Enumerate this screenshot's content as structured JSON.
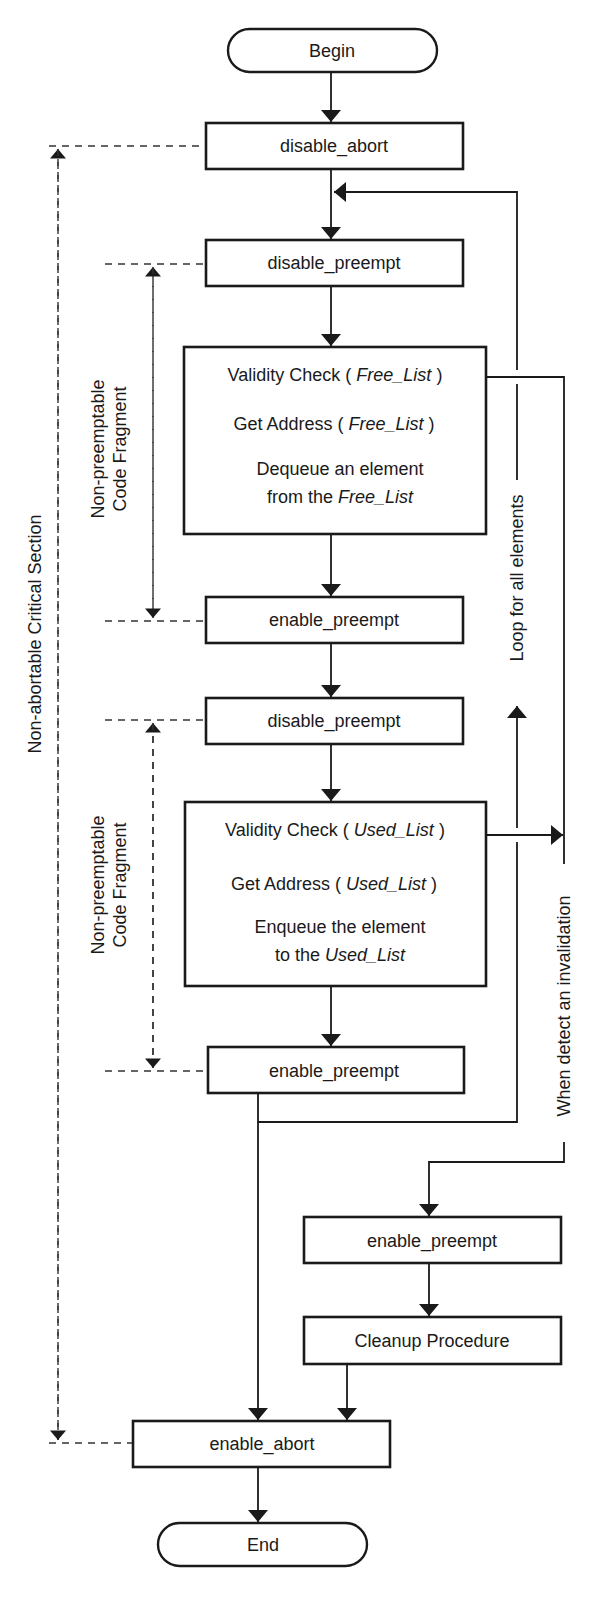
{
  "diagram": {
    "type": "flowchart",
    "terminals": {
      "begin": "Begin",
      "end": "End"
    },
    "steps": {
      "disable_abort": "disable_abort",
      "disable_preempt_1": "disable_preempt",
      "free_block": {
        "line1_prefix": "Validity Check ( ",
        "line1_italic": "Free_List",
        "line1_suffix": " )",
        "line2_prefix": "Get Address ( ",
        "line2_italic": "Free_List",
        "line2_suffix": " )",
        "line3": "Dequeue an element",
        "line4_prefix": "from the ",
        "line4_italic": "Free_List"
      },
      "enable_preempt_1": "enable_preempt",
      "disable_preempt_2": "disable_preempt",
      "used_block": {
        "line1_prefix": "Validity Check ( ",
        "line1_italic": "Used_List",
        "line1_suffix": " )",
        "line2_prefix": "Get Address ( ",
        "line2_italic": "Used_List",
        "line2_suffix": " )",
        "line3": "Enqueue the element",
        "line4_prefix": "to the ",
        "line4_italic": "Used_List"
      },
      "enable_preempt_2": "enable_preempt",
      "enable_preempt_3": "enable_preempt",
      "cleanup": "Cleanup Procedure",
      "enable_abort": "enable_abort"
    },
    "annotations": {
      "critical_section": "Non-abortable Critical Section",
      "fragment_1_line1": "Non-preemptable",
      "fragment_1_line2": "Code Fragment",
      "fragment_2_line1": "Non-preemptable",
      "fragment_2_line2": "Code Fragment",
      "loop_label": "Loop for all elements",
      "invalidation_label": "When detect an invalidation"
    },
    "colors": {
      "stroke": "#1a1a1a",
      "background": "#ffffff"
    }
  }
}
